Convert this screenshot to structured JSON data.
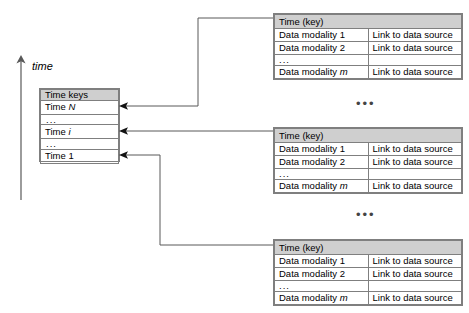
{
  "diagram": {
    "axis": {
      "label": "time",
      "direction": "up",
      "icon": "up-arrow-icon"
    },
    "time_keys_table": {
      "header": "Time keys",
      "rows": [
        {
          "label": "Time N",
          "kind": "key"
        },
        {
          "label": "...",
          "kind": "ellipsis"
        },
        {
          "label": "Time i",
          "kind": "key",
          "italic_suffix": "i"
        },
        {
          "label": "...",
          "kind": "ellipsis"
        },
        {
          "label": "Time 1",
          "kind": "key"
        }
      ]
    },
    "modality_tables": [
      {
        "header": "Time (key)",
        "columns": [
          "Data modality",
          "Link"
        ],
        "rows": [
          {
            "modality": "Data modality 1",
            "link": "Link to data source"
          },
          {
            "modality": "Data modality 2",
            "link": "Link to data source"
          },
          {
            "modality": "...",
            "link": "",
            "kind": "ellipsis"
          },
          {
            "modality": "Data modality m",
            "link": "Link to data source"
          }
        ]
      },
      {
        "header": "Time (key)",
        "columns": [
          "Data modality",
          "Link"
        ],
        "rows": [
          {
            "modality": "Data modality 1",
            "link": "Link to data source"
          },
          {
            "modality": "Data modality 2",
            "link": "Link to data source"
          },
          {
            "modality": "...",
            "link": "",
            "kind": "ellipsis"
          },
          {
            "modality": "Data modality m",
            "link": "Link to data source"
          }
        ]
      },
      {
        "header": "Time (key)",
        "columns": [
          "Data modality",
          "Link"
        ],
        "rows": [
          {
            "modality": "Data modality 1",
            "link": "Link to data source"
          },
          {
            "modality": "Data modality 2",
            "link": "Link to data source"
          },
          {
            "modality": "...",
            "link": "",
            "kind": "ellipsis"
          },
          {
            "modality": "Data modality m",
            "link": "Link to data source"
          }
        ]
      }
    ],
    "gap_ellipses": [
      "•••",
      "•••"
    ],
    "connectors": [
      {
        "from": "modality-table-1-header",
        "to": "time-keys-row-time-N"
      },
      {
        "from": "modality-table-2-header",
        "to": "time-keys-row-time-i"
      },
      {
        "from": "modality-table-3-header",
        "to": "time-keys-row-time-1"
      }
    ],
    "colors": {
      "header_fill": "#cfcfcf",
      "border": "#7f7f7f",
      "connector": "#595959",
      "text": "#000000",
      "background": "#ffffff"
    }
  }
}
